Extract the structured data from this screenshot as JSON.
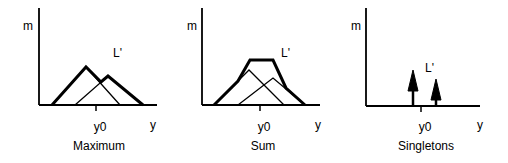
{
  "panels": [
    {
      "name": "maximum",
      "caption": "Maximum",
      "y_axis_label": "m",
      "x_axis_label": "y",
      "output_label": "L'",
      "tick_label": "y0",
      "method": "max of clipped triangular sets"
    },
    {
      "name": "sum",
      "caption": "Sum",
      "y_axis_label": "m",
      "x_axis_label": "y",
      "output_label": "L'",
      "tick_label": "y0",
      "method": "sum of triangular sets"
    },
    {
      "name": "singletons",
      "caption": "Singletons",
      "y_axis_label": "m",
      "x_axis_label": "y",
      "output_label": "L'",
      "tick_label": "y0",
      "method": "singleton spikes"
    }
  ],
  "colors": {
    "stroke": "#000000",
    "background": "#ffffff"
  }
}
